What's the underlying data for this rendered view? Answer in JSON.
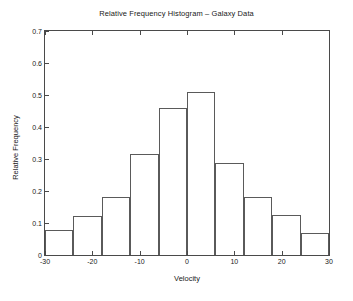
{
  "chart_data": {
    "type": "bar",
    "title": "Relative Frequency Histogram – Galaxy Data",
    "xlabel": "Velocity",
    "ylabel": "Relative Frequency",
    "xlim": [
      -30,
      30
    ],
    "ylim": [
      0,
      0.7
    ],
    "bin_width": 6,
    "grid": false,
    "legend": null,
    "xticks": [
      "-30",
      "-20",
      "-10",
      "0",
      "10",
      "20",
      "30"
    ],
    "xtick_values": [
      -30,
      -20,
      -10,
      0,
      10,
      20,
      30
    ],
    "yticks": [
      "0",
      "0.1",
      "0.2",
      "0.3",
      "0.4",
      "0.5",
      "0.6",
      "0.7"
    ],
    "ytick_values": [
      0,
      0.1,
      0.2,
      0.3,
      0.4,
      0.5,
      0.6,
      0.7
    ],
    "bin_edges": [
      -30,
      -24,
      -18,
      -12,
      -6,
      0,
      6,
      12,
      18,
      24,
      30
    ],
    "categories": [
      "-30 to -24",
      "-24 to -18",
      "-18 to -12",
      "-12 to -6",
      "-6 to 0",
      "0 to 6",
      "6 to 12",
      "12 to 18",
      "18 to 24",
      "24 to 30"
    ],
    "values": [
      0.078,
      0.122,
      0.18,
      0.316,
      0.458,
      0.509,
      0.288,
      0.18,
      0.124,
      0.068
    ],
    "bar_face_color": "#ffffff",
    "bar_edge_color": "#5a5a5a",
    "axes_color": "#4a4a4a",
    "background_color": "#ffffff"
  }
}
